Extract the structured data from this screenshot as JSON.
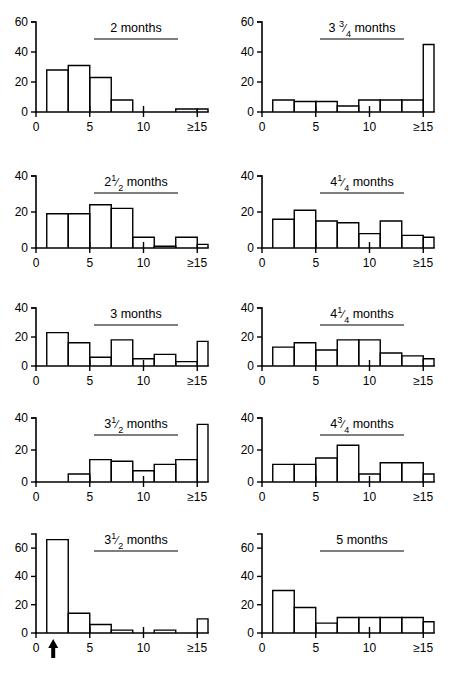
{
  "figure": {
    "name": "histogram-grid",
    "panel_count": 10,
    "columns": 2,
    "rows": 5,
    "axis_color": "#000000",
    "background": "#ffffff"
  },
  "chart_data": [
    {
      "type": "bar",
      "title": "2 months",
      "title_plain": "2 months",
      "xlabel": "",
      "ylabel": "",
      "ylim": [
        0,
        60
      ],
      "yticks": [
        0,
        20,
        40,
        60
      ],
      "ytick_labels": [
        "0",
        "20",
        "40",
        "60"
      ],
      "xlim": [
        0,
        16
      ],
      "xticks": [
        0,
        5,
        10,
        15
      ],
      "xtick_labels": [
        "0",
        "5",
        "10",
        "≥15"
      ],
      "bin_edges": [
        1,
        3,
        5,
        7,
        9,
        11,
        13,
        15,
        16
      ],
      "values": [
        28,
        31,
        23,
        8,
        0,
        0,
        2,
        2
      ],
      "grid": false,
      "legend": false,
      "annotation": ""
    },
    {
      "type": "bar",
      "title": "3 3/4 months",
      "title_plain": "3 ¾ months",
      "xlabel": "",
      "ylabel": "",
      "ylim": [
        0,
        60
      ],
      "yticks": [
        0,
        20,
        40,
        60
      ],
      "ytick_labels": [
        "0",
        "20",
        "40",
        "60"
      ],
      "xlim": [
        0,
        16
      ],
      "xticks": [
        0,
        5,
        10,
        15
      ],
      "xtick_labels": [
        "0",
        "5",
        "10",
        "≥15"
      ],
      "bin_edges": [
        1,
        3,
        5,
        7,
        9,
        11,
        13,
        15,
        16
      ],
      "values": [
        8,
        7,
        7,
        4,
        8,
        8,
        8,
        45
      ],
      "grid": false,
      "legend": false,
      "annotation": ""
    },
    {
      "type": "bar",
      "title": "2 1/2 months",
      "title_plain": "2½ months",
      "xlabel": "",
      "ylabel": "",
      "ylim": [
        0,
        40
      ],
      "yticks": [
        0,
        20,
        40
      ],
      "ytick_labels": [
        "0",
        "20",
        "40"
      ],
      "xlim": [
        0,
        16
      ],
      "xticks": [
        0,
        5,
        10,
        15
      ],
      "xtick_labels": [
        "0",
        "5",
        "10",
        "≥15"
      ],
      "bin_edges": [
        1,
        3,
        5,
        7,
        9,
        11,
        13,
        15,
        16
      ],
      "values": [
        19,
        19,
        24,
        22,
        6,
        1,
        6,
        2
      ],
      "grid": false,
      "legend": false,
      "annotation": ""
    },
    {
      "type": "bar",
      "title": "4 1/4 months",
      "title_plain": "4¼ months",
      "xlabel": "",
      "ylabel": "",
      "ylim": [
        0,
        40
      ],
      "yticks": [
        0,
        20,
        40
      ],
      "ytick_labels": [
        "0",
        "20",
        "40"
      ],
      "xlim": [
        0,
        16
      ],
      "xticks": [
        0,
        5,
        10,
        15
      ],
      "xtick_labels": [
        "0",
        "5",
        "10",
        "≥15"
      ],
      "bin_edges": [
        1,
        3,
        5,
        7,
        9,
        11,
        13,
        15,
        16
      ],
      "values": [
        16,
        21,
        15,
        14,
        8,
        15,
        7,
        6
      ],
      "grid": false,
      "legend": false,
      "annotation": ""
    },
    {
      "type": "bar",
      "title": "3 months",
      "title_plain": "3 months",
      "xlabel": "",
      "ylabel": "",
      "ylim": [
        0,
        40
      ],
      "yticks": [
        0,
        20,
        40
      ],
      "ytick_labels": [
        "0",
        "20",
        "40"
      ],
      "xlim": [
        0,
        16
      ],
      "xticks": [
        0,
        5,
        10,
        15
      ],
      "xtick_labels": [
        "0",
        "5",
        "10",
        "≥15"
      ],
      "bin_edges": [
        1,
        3,
        5,
        7,
        9,
        11,
        13,
        15,
        16
      ],
      "values": [
        23,
        16,
        6,
        18,
        5,
        8,
        3,
        17
      ],
      "grid": false,
      "legend": false,
      "annotation": ""
    },
    {
      "type": "bar",
      "title": "4 1/4 months (second)",
      "title_plain": "4¼ months",
      "xlabel": "",
      "ylabel": "",
      "ylim": [
        0,
        40
      ],
      "yticks": [
        0,
        20,
        40
      ],
      "ytick_labels": [
        "0",
        "20",
        "40"
      ],
      "xlim": [
        0,
        16
      ],
      "xticks": [
        0,
        5,
        10,
        15
      ],
      "xtick_labels": [
        "0",
        "5",
        "10",
        "≥15"
      ],
      "bin_edges": [
        1,
        3,
        5,
        7,
        9,
        11,
        13,
        15,
        16
      ],
      "values": [
        13,
        16,
        11,
        18,
        18,
        9,
        7,
        5
      ],
      "grid": false,
      "legend": false,
      "annotation": ""
    },
    {
      "type": "bar",
      "title": "3 1/2 months",
      "title_plain": "3½ months",
      "xlabel": "",
      "ylabel": "",
      "ylim": [
        0,
        40
      ],
      "yticks": [
        0,
        20,
        40
      ],
      "ytick_labels": [
        "0",
        "20",
        "40"
      ],
      "xlim": [
        0,
        16
      ],
      "xticks": [
        0,
        5,
        10,
        15
      ],
      "xtick_labels": [
        "0",
        "5",
        "10",
        "≥15"
      ],
      "bin_edges": [
        1,
        3,
        5,
        7,
        9,
        11,
        13,
        15,
        16
      ],
      "values": [
        0,
        5,
        14,
        13,
        7,
        11,
        14,
        36
      ],
      "grid": false,
      "legend": false,
      "annotation": ""
    },
    {
      "type": "bar",
      "title": "4 3/4 months",
      "title_plain": "4¾ months",
      "xlabel": "",
      "ylabel": "",
      "ylim": [
        0,
        40
      ],
      "yticks": [
        0,
        20,
        40
      ],
      "ytick_labels": [
        "0",
        "20",
        "40"
      ],
      "xlim": [
        0,
        16
      ],
      "xticks": [
        0,
        5,
        10,
        15
      ],
      "xtick_labels": [
        "0",
        "5",
        "10",
        "≥15"
      ],
      "bin_edges": [
        1,
        3,
        5,
        7,
        9,
        11,
        13,
        15,
        16
      ],
      "values": [
        11,
        11,
        15,
        23,
        5,
        12,
        12,
        5
      ],
      "grid": false,
      "legend": false,
      "annotation": ""
    },
    {
      "type": "bar",
      "title": "3 1/2 months (second)",
      "title_plain": "3½ months",
      "xlabel": "",
      "ylabel": "",
      "ylim": [
        0,
        70
      ],
      "yticks": [
        0,
        20,
        40,
        60
      ],
      "ytick_labels": [
        "0",
        "20",
        "40",
        "60"
      ],
      "xlim": [
        0,
        16
      ],
      "xticks": [
        0,
        5,
        10,
        15
      ],
      "xtick_labels": [
        "0",
        "5",
        "10",
        "≥15"
      ],
      "bin_edges": [
        1,
        3,
        5,
        7,
        9,
        11,
        13,
        15,
        16
      ],
      "values": [
        66,
        14,
        6,
        2,
        0,
        2,
        0,
        10
      ],
      "grid": false,
      "legend": false,
      "annotation": "arrow marker at x = 1.6 below axis"
    },
    {
      "type": "bar",
      "title": "5 months",
      "title_plain": "5 months",
      "xlabel": "",
      "ylabel": "",
      "ylim": [
        0,
        70
      ],
      "yticks": [
        0,
        20,
        40,
        60
      ],
      "ytick_labels": [
        "0",
        "20",
        "40",
        "60"
      ],
      "xlim": [
        0,
        16
      ],
      "xticks": [
        0,
        5,
        10,
        15
      ],
      "xtick_labels": [
        "0",
        "5",
        "10",
        "≥15"
      ],
      "bin_edges": [
        1,
        3,
        5,
        7,
        9,
        11,
        13,
        15,
        16
      ],
      "values": [
        30,
        18,
        7,
        11,
        11,
        11,
        11,
        8
      ],
      "grid": false,
      "legend": false,
      "annotation": ""
    }
  ]
}
